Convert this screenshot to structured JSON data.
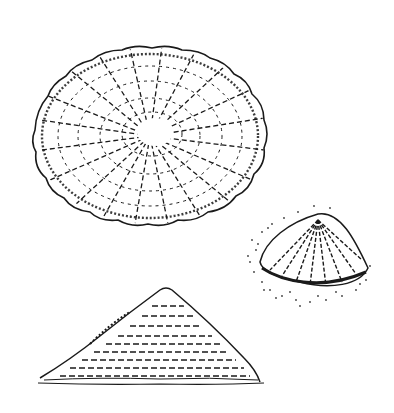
{
  "image": {
    "description": "Pen-and-ink illustration of limpet shells shown from three views",
    "background": "#ffffff",
    "ink": "#1a1a1a",
    "figures": [
      {
        "id": "top-view",
        "label": "limpet shell top view",
        "cx": 150,
        "cy": 136,
        "rx": 117,
        "ry": 90
      },
      {
        "id": "oblique-view",
        "label": "limpet shell oblique view",
        "cx": 312,
        "cy": 258
      },
      {
        "id": "side-view",
        "label": "limpet shell side profile",
        "apex": [
          166,
          288
        ],
        "base_left": 38,
        "base_right": 262,
        "base_y": 383
      }
    ]
  }
}
